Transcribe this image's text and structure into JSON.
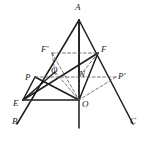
{
  "figure": {
    "kind": "geometry-diagram",
    "width": 149,
    "height": 142,
    "background_color": "#ffffff",
    "stroke_color": "#1d1d1d",
    "dashed_stroke_color": "#555555",
    "labels": [
      {
        "id": "A",
        "text": "A",
        "x": 75,
        "y": 3,
        "point_x": 79,
        "point_y": 20
      },
      {
        "id": "Fp",
        "text": "F'",
        "x": 41,
        "y": 45,
        "point_x": 52,
        "point_y": 53
      },
      {
        "id": "F",
        "text": "F",
        "x": 101,
        "y": 45,
        "point_x": 98,
        "point_y": 53
      },
      {
        "id": "P",
        "text": "P",
        "x": 25,
        "y": 73,
        "point_x": 35,
        "point_y": 77
      },
      {
        "id": "Q",
        "text": "Q",
        "x": 51,
        "y": 66,
        "point_x": 55,
        "point_y": 72
      },
      {
        "id": "N",
        "text": "N",
        "x": 79,
        "y": 70,
        "point_x": 79,
        "point_y": 77
      },
      {
        "id": "Pp",
        "text": "P'",
        "x": 118,
        "y": 72,
        "point_x": 116,
        "point_y": 77
      },
      {
        "id": "E",
        "text": "E",
        "x": 13,
        "y": 99,
        "point_x": 23,
        "point_y": 100
      },
      {
        "id": "O",
        "text": "O",
        "x": 82,
        "y": 100,
        "point_x": 79,
        "point_y": 100
      },
      {
        "id": "B",
        "text": "B",
        "x": 12,
        "y": 117,
        "point_x": 17,
        "point_y": 124
      },
      {
        "id": "C",
        "text": "C",
        "x": 130,
        "y": 117,
        "point_x": 133,
        "point_y": 124
      }
    ],
    "solid_segments": [
      {
        "name": "side-A-B",
        "x1": 79,
        "y1": 20,
        "x2": 17,
        "y2": 124
      },
      {
        "name": "side-A-C",
        "x1": 79,
        "y1": 20,
        "x2": 133,
        "y2": 124
      },
      {
        "name": "axis-A-O",
        "x1": 79,
        "y1": 20,
        "x2": 79,
        "y2": 128
      },
      {
        "name": "cevian-A-O",
        "x1": 79,
        "y1": 20,
        "x2": 79,
        "y2": 100
      },
      {
        "name": "segment-F-O",
        "x1": 98,
        "y1": 53,
        "x2": 79,
        "y2": 100
      },
      {
        "name": "segment-E-F",
        "x1": 23,
        "y1": 100,
        "x2": 98,
        "y2": 53
      },
      {
        "name": "segment-P-O",
        "x1": 35,
        "y1": 77,
        "x2": 79,
        "y2": 100
      },
      {
        "name": "segment-P-E",
        "x1": 35,
        "y1": 77,
        "x2": 23,
        "y2": 100
      },
      {
        "name": "segment-E-O",
        "x1": 23,
        "y1": 100,
        "x2": 79,
        "y2": 100
      },
      {
        "name": "segment-E-Q",
        "x1": 23,
        "y1": 100,
        "x2": 55,
        "y2": 72
      }
    ],
    "dashed_segments": [
      {
        "name": "chord-Fp-F",
        "x1": 52,
        "y1": 53,
        "x2": 98,
        "y2": 53
      },
      {
        "name": "chord-P-Pp",
        "x1": 35,
        "y1": 77,
        "x2": 116,
        "y2": 77
      },
      {
        "name": "segment-Fp-Q",
        "x1": 52,
        "y1": 53,
        "x2": 55,
        "y2": 72
      },
      {
        "name": "segment-Fp-O",
        "x1": 52,
        "y1": 53,
        "x2": 79,
        "y2": 100
      },
      {
        "name": "segment-F-N",
        "x1": 98,
        "y1": 53,
        "x2": 79,
        "y2": 77
      },
      {
        "name": "segment-Q-O",
        "x1": 55,
        "y1": 72,
        "x2": 79,
        "y2": 100
      },
      {
        "name": "segment-N-O",
        "x1": 79,
        "y1": 77,
        "x2": 79,
        "y2": 100
      },
      {
        "name": "segment-Pp-O",
        "x1": 116,
        "y1": 77,
        "x2": 79,
        "y2": 100
      },
      {
        "name": "segment-E-Opp",
        "x1": 23,
        "y1": 100,
        "x2": 79,
        "y2": 100
      }
    ]
  }
}
